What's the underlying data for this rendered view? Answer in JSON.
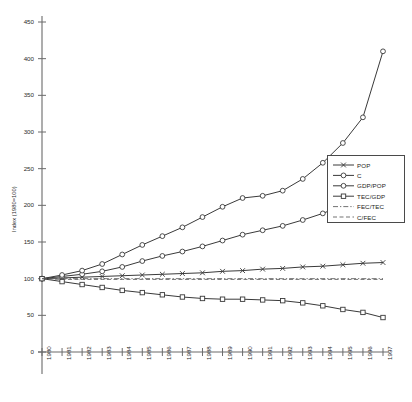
{
  "chart_data": {
    "type": "line",
    "title": "",
    "subtitle": "",
    "xlabel": "",
    "ylabel": "Index (1980=100)",
    "xlim": [
      1980,
      1997
    ],
    "ylim": [
      0,
      450
    ],
    "ytick_interval": 50,
    "grid": false,
    "legend_position": "center-right",
    "x": [
      1980,
      1981,
      1982,
      1983,
      1984,
      1985,
      1986,
      1987,
      1988,
      1989,
      1990,
      1991,
      1992,
      1993,
      1994,
      1995,
      1996,
      1997
    ],
    "categories": [
      "1980",
      "1981",
      "1982",
      "1983",
      "1984",
      "1985",
      "1986",
      "1987",
      "1988",
      "1989",
      "1990",
      "1991",
      "1992",
      "1993",
      "1994",
      "1995",
      "1996",
      "1997"
    ],
    "ytick_labels": [
      "0",
      "50",
      "100",
      "150",
      "200",
      "250",
      "300",
      "350",
      "400",
      "450"
    ],
    "series": [
      {
        "name": "POP",
        "marker": "x",
        "line_style": "solid",
        "color": "#3a3a3a",
        "values": [
          100,
          101,
          102,
          103,
          104,
          105,
          106,
          107,
          108,
          110,
          111,
          113,
          114,
          116,
          117,
          119,
          121,
          122
        ]
      },
      {
        "name": "C",
        "marker": "circle",
        "line_style": "solid",
        "color": "#3a3a3a",
        "values": [
          100,
          103,
          106,
          110,
          116,
          124,
          131,
          137,
          144,
          152,
          160,
          166,
          172,
          180,
          189,
          200,
          215,
          238
        ]
      },
      {
        "name": "GDP/POP",
        "marker": "circle",
        "line_style": "solid",
        "color": "#3a3a3a",
        "values": [
          100,
          105,
          111,
          120,
          133,
          146,
          158,
          170,
          184,
          198,
          210,
          213,
          220,
          236,
          258,
          285,
          320,
          410
        ]
      },
      {
        "name": "TEC/GDP",
        "marker": "square",
        "line_style": "solid",
        "color": "#3a3a3a",
        "values": [
          100,
          96,
          92,
          88,
          84,
          81,
          78,
          75,
          73,
          72,
          72,
          71,
          70,
          67,
          63,
          58,
          54,
          47
        ]
      },
      {
        "name": "FEC/TEC",
        "marker": "none",
        "line_style": "dashdot",
        "color": "#5a5a5a",
        "values": [
          100,
          100,
          100,
          100,
          100,
          100,
          100,
          100,
          100,
          100,
          100,
          100,
          100,
          100,
          100,
          100,
          100,
          100
        ]
      },
      {
        "name": "C/FEC",
        "marker": "none",
        "line_style": "dashed",
        "color": "#5a5a5a",
        "values": [
          100,
          99,
          99,
          99,
          99,
          99,
          99,
          99,
          99,
          99,
          99,
          99,
          99,
          99,
          99,
          99,
          99,
          99
        ]
      }
    ]
  },
  "legend": {
    "entries": [
      {
        "label": "POP"
      },
      {
        "label": "C"
      },
      {
        "label": "GDP/POP"
      },
      {
        "label": "TEC/GDP"
      },
      {
        "label": "FEC/TEC"
      },
      {
        "label": "C/FEC"
      }
    ]
  }
}
